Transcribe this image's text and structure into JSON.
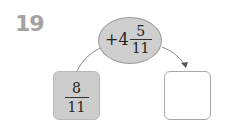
{
  "problem_number": "19",
  "operator": {
    "sign": "+",
    "whole": "4",
    "numerator": "5",
    "denominator": "11"
  },
  "start_value": {
    "numerator": "8",
    "denominator": "11"
  },
  "answer_box": {
    "value": ""
  },
  "colors": {
    "number": "#a3a3a3",
    "ellipse_fill": "#cfcfcf",
    "start_box_fill": "#cdcdcd",
    "answer_box_border": "#a8a8a8"
  }
}
